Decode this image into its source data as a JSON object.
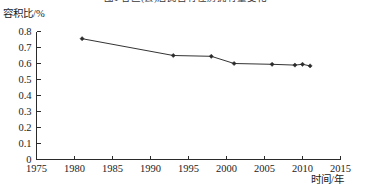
{
  "figure": {
    "title": "图1  各区(县)居民自有住房拥有量变化",
    "title_clipped": true,
    "background_color": "#ffffff",
    "line_color": "#333333",
    "marker_color": "#2b2b2b",
    "axis_color": "#2a2a2a"
  },
  "chart_data": {
    "type": "line",
    "title": "图1  各区(县)居民自有住房拥有量变化",
    "xlabel": "时间/年",
    "ylabel": "容积比/%",
    "xlim": [
      1975,
      2015
    ],
    "ylim": [
      0,
      0.8
    ],
    "grid": false,
    "legend": false,
    "xticks": [
      1975,
      1980,
      1985,
      1990,
      1995,
      2000,
      2005,
      2010,
      2015
    ],
    "xtick_labels": [
      "1975",
      "1980",
      "1985",
      "1990",
      "1995",
      "2000",
      "2005",
      "2010",
      "2015"
    ],
    "yticks": [
      0,
      0.1,
      0.2,
      0.3,
      0.4,
      0.5,
      0.6,
      0.7,
      0.8
    ],
    "ytick_labels": [
      "0",
      "0.1",
      "0.2",
      "0.3",
      "0.4",
      "0.5",
      "0.6",
      "0.7",
      "0.8"
    ],
    "series": [
      {
        "name": "容积比",
        "marker": "diamond",
        "x": [
          1981,
          1993,
          1998,
          2001,
          2006,
          2009,
          2010,
          2011
        ],
        "values": [
          0.755,
          0.65,
          0.645,
          0.6,
          0.595,
          0.59,
          0.595,
          0.585
        ]
      }
    ]
  }
}
